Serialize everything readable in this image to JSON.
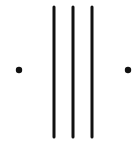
{
  "diagram": {
    "background": "#ffffff",
    "stroke_color": "#111111",
    "lines": [
      {
        "x": 54,
        "y1": 7,
        "y2": 137,
        "width": 3
      },
      {
        "x": 73,
        "y1": 7,
        "y2": 137,
        "width": 3
      },
      {
        "x": 92,
        "y1": 7,
        "y2": 137,
        "width": 3
      }
    ],
    "dots": [
      {
        "cx": 19,
        "cy": 70,
        "r": 3.2
      },
      {
        "cx": 128,
        "cy": 70,
        "r": 3.2
      }
    ]
  }
}
